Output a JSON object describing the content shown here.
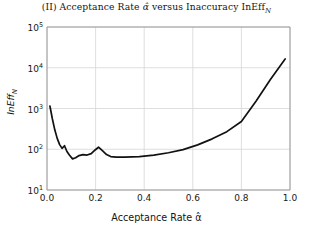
{
  "chart_data": {
    "type": "line",
    "title": "(II) Acceptance Rate α̂ versus Inaccuracy InEff",
    "title_prefix": "(II) Acceptance Rate ",
    "title_alpha": "α̂",
    "title_middle": " versus Inaccuracy InEff",
    "title_subscript": "N",
    "xlabel_text": "Acceptance Rate ",
    "xlabel_alpha": "α̂",
    "ylabel_text": "InEff",
    "ylabel_subscript": "N",
    "xlim": [
      0.0,
      1.0
    ],
    "ylim": [
      10,
      100000
    ],
    "yscale": "log",
    "xscale": "linear",
    "grid": true,
    "legend": "none",
    "line_color": "#111111",
    "grid_color": "#d4d4d4",
    "axis_color": "#b0b0b0",
    "xticks": [
      "0.0",
      "0.2",
      "0.4",
      "0.6",
      "0.8",
      "1.0"
    ],
    "xtick_values": [
      0.0,
      0.2,
      0.4,
      0.6,
      0.8,
      1.0
    ],
    "yticks": [
      "10",
      "10",
      "10",
      "10",
      "10"
    ],
    "ytick_exponents": [
      "1",
      "2",
      "3",
      "4",
      "5"
    ],
    "ytick_values": [
      10,
      100,
      1000,
      10000,
      100000
    ],
    "x": [
      0.012,
      0.022,
      0.032,
      0.042,
      0.052,
      0.062,
      0.072,
      0.082,
      0.092,
      0.105,
      0.118,
      0.132,
      0.148,
      0.165,
      0.182,
      0.198,
      0.212,
      0.228,
      0.245,
      0.262,
      0.285,
      0.32,
      0.38,
      0.44,
      0.5,
      0.56,
      0.62,
      0.68,
      0.74,
      0.8,
      0.86,
      0.92,
      0.98
    ],
    "values": [
      1150,
      560,
      300,
      185,
      130,
      105,
      122,
      88,
      72,
      58,
      62,
      70,
      74,
      72,
      78,
      96,
      112,
      92,
      74,
      66,
      64,
      64,
      66,
      72,
      82,
      98,
      128,
      180,
      270,
      480,
      1500,
      5200,
      16500
    ]
  }
}
